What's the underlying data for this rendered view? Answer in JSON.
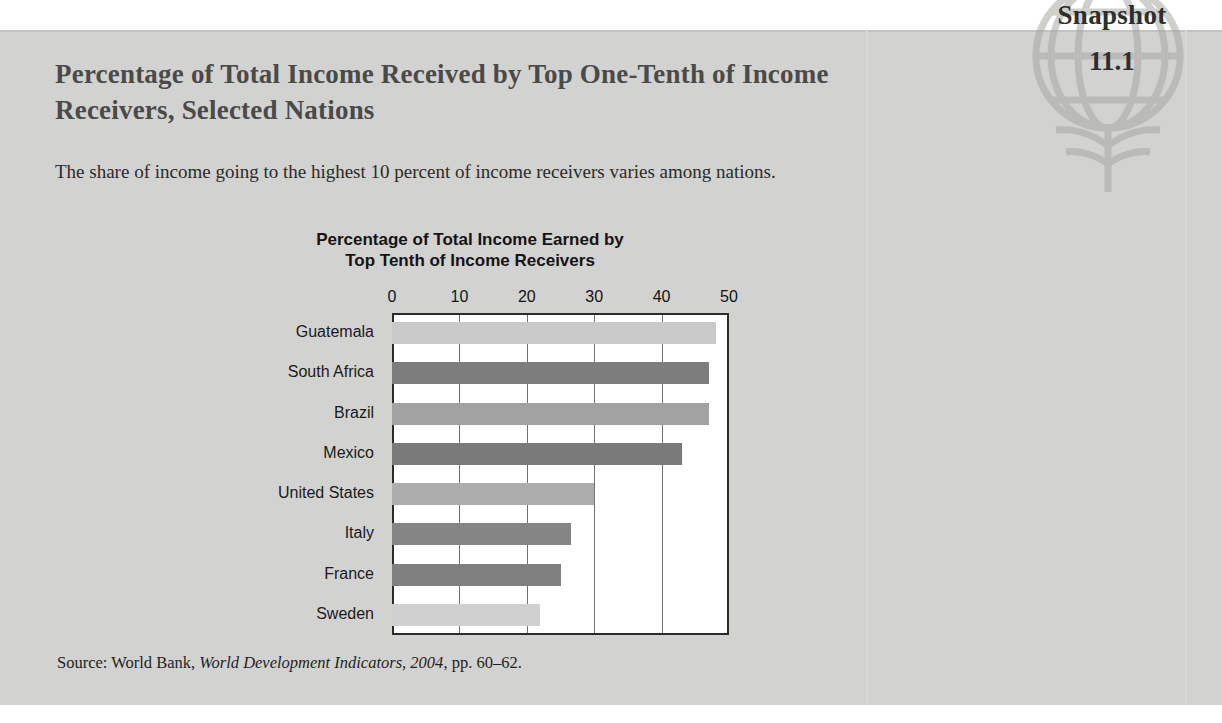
{
  "badge": {
    "word": "Snapshot",
    "number": "11.1",
    "globe_icon": "globe-icon"
  },
  "panel": {
    "title": "Percentage of Total Income Received by Top One-Tenth of Income Receivers, Selected Nations",
    "subtitle": "The share of income going to the highest 10 percent of income receivers varies among nations."
  },
  "source": {
    "prefix": "Source: World Bank, ",
    "italic": "World Development Indicators, 2004",
    "suffix": ", pp. 60–62."
  },
  "colors": {
    "panel_background": "#d2d2d0",
    "plot_background": "#ffffff",
    "axis": "#2b2b2b",
    "gridline": "#6f6f6f",
    "title_text": "#4a4a4a",
    "body_text": "#2b2b2b"
  },
  "chart_data": {
    "type": "bar",
    "orientation": "horizontal",
    "title": "Percentage of Total Income Earned by Top Tenth of Income Receivers",
    "title_line_1": "Percentage of Total Income Earned by",
    "title_line_2": "Top Tenth of Income Receivers",
    "xlabel": "",
    "ylabel": "",
    "xlim": [
      0,
      50
    ],
    "xticks": [
      0,
      10,
      20,
      30,
      40,
      50
    ],
    "grid": true,
    "legend": "none",
    "categories": [
      "Guatemala",
      "South Africa",
      "Brazil",
      "Mexico",
      "United States",
      "Italy",
      "France",
      "Sweden"
    ],
    "values": [
      48,
      47,
      47,
      43,
      30,
      26.5,
      25,
      22
    ],
    "bar_colors": [
      "#c9c9c9",
      "#7d7d7d",
      "#a2a2a2",
      "#7a7a7a",
      "#adadad",
      "#858585",
      "#808080",
      "#d0d0d0"
    ]
  }
}
